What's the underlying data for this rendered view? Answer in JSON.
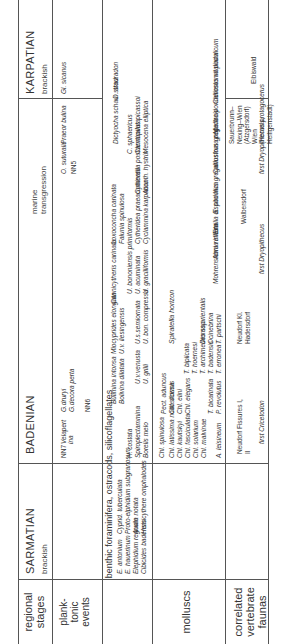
{
  "rows": {
    "stages": "regional stages",
    "planktonic": "plank-\ntonic\nevents",
    "benthic": "benthic foraminifera, ostracods, silicoflagellates",
    "molluscs": "molluscs",
    "vertebrates": "correlated vertebrate faunas"
  },
  "stages": [
    {
      "name": "SARMATIAN",
      "environment": "brackish"
    },
    {
      "name": "BADENIAN",
      "environment": "marine transgression"
    },
    {
      "name": "KARPATIAN",
      "environment": "brackish"
    }
  ],
  "planktonic_events": [
    "NN7",
    "Velapert ina",
    "G.druryi",
    "G.decora perta",
    "NN6",
    "O. suturalis",
    "NN5",
    "Praeor bulina",
    "Gl. sicanus"
  ],
  "benthic": {
    "sarmatian": [
      "Cibicides badensis",
      "Elephidium regnum",
      "E. hauerinum",
      "E. antonium",
      "Hemicythere omphalodes",
      "Aurila notata",
      "Proto-elphidium subgranosum",
      "Cyprid. tuberculata"
    ],
    "badenian_upper": [
      "Bolivina dilatata",
      "Bulimina intonsa",
      "U.v. liesingensis",
      "Miocyprides elongata",
      "Cannicytheris carinata"
    ],
    "badenian_mid": [
      "Heterostegina praecostata carinata politaesta",
      "H. costata",
      "Spiroplectammina",
      "Borelis melo",
      "H.c.costata",
      "U. macrocarinata",
      "U. grilli",
      "U.v.venusta",
      "U. bon. compressa",
      "U.s.semiornata"
    ],
    "badenian_lower": [
      "U. gracilliformis",
      "U. acuminata",
      "U. bononiensis primiformis",
      "U. parkeri breviformis",
      "Cyclammina karpatica",
      "Cytheridea praeacuminata",
      "Falunia spinulosa",
      "Loxoconcha carinata",
      "Loxoconcha variolata",
      "Acanth. hystrix",
      "Cytherella postdenticulata",
      "Mesocena elliptica",
      "Cannopilus picassoi",
      "C. sphaericus",
      "Dictyocha schau. strad.",
      "D. stauradon"
    ]
  },
  "molluscs": {
    "sarmatian": [
      "Mohrensternia inflata",
      "Abra reflexa",
      "Ervilia dissita",
      "E. podolica",
      "Irus gregarius",
      "Calliostoma popellacki",
      "Irus greg.",
      "Mactra ponderosus vitaliana",
      "Calliostoma podolicum"
    ],
    "badenian": [
      "Chl. malvinae",
      "Chl. solarium",
      "Chl. fasciculata",
      "Chl. elegans",
      "Chl. kautskyi",
      "Chl. elini",
      "Chl. latissima nodosiformis",
      "Chl. scissa",
      "Pect. aduncus",
      "Chl. spinulosa",
      "A. leisineum",
      "P. revolutus",
      "T. bicarinata",
      "T. erronea",
      "T. badensis",
      "T. archimedes ssp.",
      "T. hoernesi",
      "T. biplicata",
      "T. partschi",
      "Ocinebrina",
      "Dioma orientalis",
      "Vaginella austriaca"
    ],
    "horizon": "Spiratella horizon"
  },
  "vertebrates": {
    "faunas": [
      "Sauerbrunn–Nexing–Wien (Atzgersdorf) Wien (Hernals, Heiligenstadt)",
      "Walbersdorf",
      "Neudorf Kl. Hadersdorf",
      "Neudorf Fissures I, II",
      "Eibiswald"
    ],
    "events": [
      "first Dryopithecus protagocerus",
      "first Dryopithecus",
      "first Cricetodon"
    ]
  }
}
